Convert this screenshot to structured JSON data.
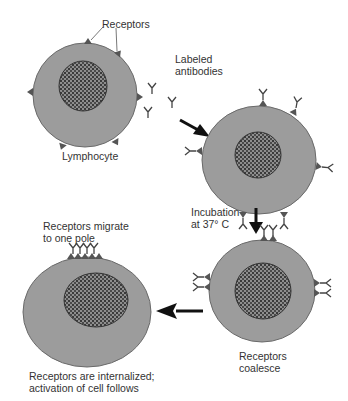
{
  "labels": {
    "receptors": "Receptors",
    "labeled_antibodies_1": "Labeled",
    "labeled_antibodies_2": "antibodies",
    "lymphocyte": "Lymphocyte",
    "incubation_1": "Incubation",
    "incubation_2": "at 37° C",
    "coalesce_1": "Receptors",
    "coalesce_2": "coalesce",
    "migrate_1": "Receptors migrate",
    "migrate_2": "to one pole",
    "internalized_1": "Receptors are internalized;",
    "internalized_2": "activation of cell follows"
  },
  "colors": {
    "cell": "#9c9c9c",
    "cell_edge": "#6a6a6a",
    "nucleus_bg": "#8a8a8a",
    "nucleus_dot": "#333333",
    "receptor": "#555555",
    "arrow": "#111111"
  }
}
